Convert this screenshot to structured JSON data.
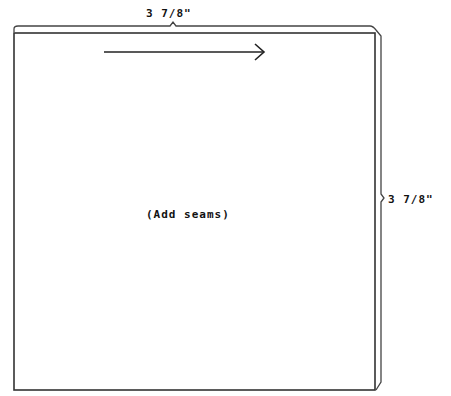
{
  "pattern": {
    "shape": "square",
    "width_label": "3 7/8\"",
    "height_label": "3 7/8\"",
    "center_note": "(Add seams)",
    "grain_arrow": "right",
    "line_color": "#333333",
    "background": "#ffffff"
  }
}
